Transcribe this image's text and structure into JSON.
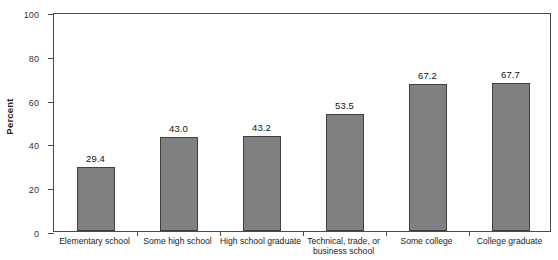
{
  "chart_data": {
    "type": "bar",
    "title": "",
    "xlabel": "",
    "ylabel": "Percent",
    "ylim": [
      0,
      100
    ],
    "yticks": [
      "0",
      "20",
      "40",
      "60",
      "80",
      "100"
    ],
    "grid": false,
    "legend": "none",
    "categories": [
      "Elementary school",
      "Some high school",
      "High school graduate",
      "Technical, trade, or business school",
      "Some college",
      "College graduate"
    ],
    "category_lines": [
      [
        "Elementary school"
      ],
      [
        "Some high school"
      ],
      [
        "High school graduate"
      ],
      [
        "Technical, trade, or",
        "business school"
      ],
      [
        "Some college"
      ],
      [
        "College graduate"
      ]
    ],
    "values": [
      29.4,
      43.0,
      43.2,
      53.5,
      67.2,
      67.7
    ],
    "value_labels": [
      "29.4",
      "43.0",
      "43.2",
      "53.5",
      "67.2",
      "67.7"
    ],
    "bar_color": "#808080",
    "bar_edge_color": "#3f3f3f",
    "axis_color": "#4a4a4a"
  }
}
